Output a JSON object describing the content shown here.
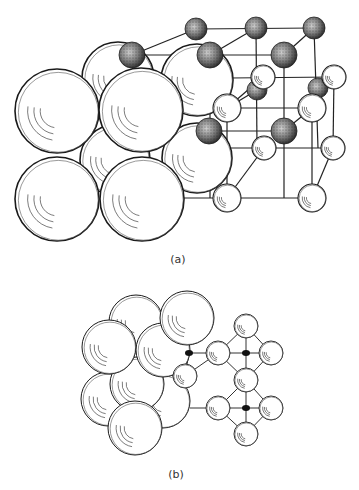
{
  "figure": {
    "panel_a": {
      "label": "(a)",
      "description": "Rock-salt (NaCl-type) crystal structure: space-filling packing of large ions alongside ball-and-stick unit cell",
      "large_spheres": [
        {
          "cx": 118,
          "cy": 78,
          "r": 36
        },
        {
          "cx": 197,
          "cy": 80,
          "r": 36
        },
        {
          "cx": 197,
          "cy": 158,
          "r": 35
        },
        {
          "cx": 115,
          "cy": 160,
          "r": 35
        },
        {
          "cx": 57,
          "cy": 111,
          "r": 42
        },
        {
          "cx": 141,
          "cy": 110,
          "r": 42
        },
        {
          "cx": 57,
          "cy": 199,
          "r": 42
        },
        {
          "cx": 142,
          "cy": 199,
          "r": 42
        }
      ],
      "dark_spheres": [
        {
          "cx": 196,
          "cy": 29,
          "r": 11
        },
        {
          "cx": 256,
          "cy": 28,
          "r": 11
        },
        {
          "cx": 314,
          "cy": 28,
          "r": 11
        },
        {
          "cx": 132,
          "cy": 55,
          "r": 13
        },
        {
          "cx": 210,
          "cy": 55,
          "r": 13
        },
        {
          "cx": 284,
          "cy": 55,
          "r": 13
        },
        {
          "cx": 257,
          "cy": 90,
          "r": 10
        },
        {
          "cx": 318,
          "cy": 88,
          "r": 10
        },
        {
          "cx": 209,
          "cy": 131,
          "r": 13
        },
        {
          "cx": 284,
          "cy": 131,
          "r": 13
        }
      ],
      "white_spheres": [
        {
          "cx": 263,
          "cy": 77,
          "r": 12
        },
        {
          "cx": 334,
          "cy": 77,
          "r": 12
        },
        {
          "cx": 227,
          "cy": 108,
          "r": 14
        },
        {
          "cx": 312,
          "cy": 108,
          "r": 14
        },
        {
          "cx": 264,
          "cy": 148,
          "r": 12
        },
        {
          "cx": 333,
          "cy": 148,
          "r": 12
        },
        {
          "cx": 227,
          "cy": 198,
          "r": 14
        },
        {
          "cx": 312,
          "cy": 198,
          "r": 14
        }
      ]
    },
    "panel_b": {
      "label": "(b)",
      "description": "Projection view of the same structure showing octahedral coordination",
      "large_spheres": [
        {
          "cx": 136,
          "cy": 322,
          "r": 27
        },
        {
          "cx": 108,
          "cy": 399,
          "r": 27
        },
        {
          "cx": 163,
          "cy": 401,
          "r": 27
        },
        {
          "cx": 137,
          "cy": 384,
          "r": 27
        },
        {
          "cx": 109,
          "cy": 347,
          "r": 27
        },
        {
          "cx": 163,
          "cy": 350,
          "r": 27
        },
        {
          "cx": 187,
          "cy": 318,
          "r": 27
        },
        {
          "cx": 135,
          "cy": 428,
          "r": 27
        }
      ],
      "small_spheres": [
        {
          "cx": 185,
          "cy": 376,
          "r": 12
        },
        {
          "cx": 218,
          "cy": 353,
          "r": 12
        },
        {
          "cx": 246,
          "cy": 326,
          "r": 12
        },
        {
          "cx": 271,
          "cy": 353,
          "r": 12
        },
        {
          "cx": 246,
          "cy": 380,
          "r": 12
        },
        {
          "cx": 218,
          "cy": 408,
          "r": 12
        },
        {
          "cx": 271,
          "cy": 408,
          "r": 12
        },
        {
          "cx": 246,
          "cy": 434,
          "r": 12
        }
      ],
      "dark_dots": [
        {
          "cx": 189,
          "cy": 353,
          "r": 3
        },
        {
          "cx": 246,
          "cy": 353,
          "r": 3
        },
        {
          "cx": 246,
          "cy": 408,
          "r": 3
        }
      ]
    },
    "colors": {
      "stroke": "#1a1a1a",
      "dark_fill": "#5a5a5a",
      "background": "#ffffff"
    }
  }
}
